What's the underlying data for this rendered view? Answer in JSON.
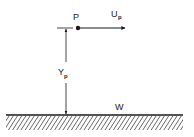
{
  "diagram": {
    "point_label": "P",
    "velocity_label": {
      "main": "U",
      "subscript": "p"
    },
    "distance_label": {
      "main": "Y",
      "subscript": "p"
    },
    "wall_label": "W",
    "ink_color": "#1a1a1a",
    "background_color": "#ffffff"
  }
}
